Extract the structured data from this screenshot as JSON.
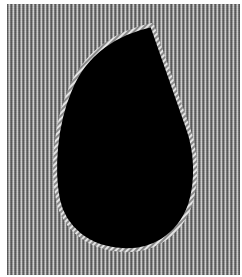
{
  "image": {
    "description": "Grey pinstripe fabric panel with a black teardrop-shaped cutout outlined by a twisted white cord",
    "colors": {
      "background": "#ffffff",
      "fabric_dark": "#5a5a5a",
      "fabric_mid": "#9a9a9a",
      "fabric_light": "#cfcfcf",
      "cutout": "#000000",
      "cord": "#d8d8d8"
    }
  }
}
